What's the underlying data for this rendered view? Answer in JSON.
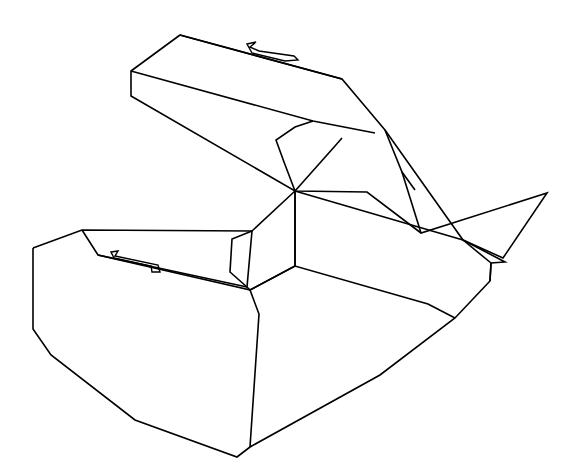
{
  "image": {
    "title": "Open box line drawing",
    "subject": "open-carton-3d-line-drawing",
    "width": 577,
    "height": 469,
    "background_color": "#ffffff",
    "line_color": "#000000",
    "line_width": 1.6,
    "style": "monochrome outline / wireframe, no fill, no text labels"
  },
  "parts": [
    {
      "id": "lid",
      "label": "Lid panel (open, raised at back)"
    },
    {
      "id": "lid-front-rim",
      "label": "Lid front rim band"
    },
    {
      "id": "lid-left-end",
      "label": "Lid left end flap"
    },
    {
      "id": "lid-right-end",
      "label": "Lid right end flap"
    },
    {
      "id": "lid-tab",
      "label": "Lid locking tab notch"
    },
    {
      "id": "lid-tongue",
      "label": "Lid tongue / closure flap"
    },
    {
      "id": "body",
      "label": "Box body / tray"
    },
    {
      "id": "body-front-panel",
      "label": "Box front panel"
    },
    {
      "id": "body-left-panel",
      "label": "Box left end panel"
    },
    {
      "id": "body-right-panel",
      "label": "Box right end panel"
    },
    {
      "id": "body-interior",
      "label": "Box interior floor"
    },
    {
      "id": "body-slot",
      "label": "Front panel tab slot"
    },
    {
      "id": "body-inner-flap",
      "label": "Inner center flap"
    }
  ],
  "geometry": {
    "lid_outline": "M 180,35 L 131,71 L 131,96 L 295,191 L 367,192 L 421,233 L 547,193 L 503,258 L 463,240 L 385,130 L 342,79 Z",
    "lid_front_fold": "M 131,71 L 313,121 L 375,133",
    "lid_top_edge": "M 180,35 L 342,79",
    "lid_right_inner": "M 385,130 L 402,172 L 415,190",
    "lid_right_fold": "M 402,172 L 421,233",
    "lid_tongue": "M 313,121 L 295,127 L 276,140 L 284,162 L 295,191 L 335,146 L 342,138",
    "lid_tab": "M 247,44 L 256,42 L 250,47 L 259,51 L 294,56 L 298,60 L 285,61 L 252,53 Z",
    "body_outline": "M 33,248 L 33,329 L 51,355 L 135,420 L 237,457 L 250,447 L 380,375 L 455,318 L 490,281 L 491,263 L 505,262 L 463,240",
    "body_top_rim": "M 33,248 L 82,230 L 252,231 L 295,191",
    "body_front_top": "M 82,230 L 98,255 L 250,290 L 259,314 L 250,447",
    "body_front_fold": "M 98,255 L 247,287",
    "body_interior_back": "M 295,191 L 463,240",
    "body_interior_right": "M 463,240 L 491,263",
    "body_interior_floor": "M 250,290 L 295,266 L 428,304 L 455,318",
    "body_inner_flap": "M 252,231 L 247,287 L 250,290 L 295,266 L 295,191",
    "body_inner_flap_left": "M 252,231 L 232,239 L 230,272 L 247,287",
    "body_center_fold": "M 295,191 L 295,266",
    "body_slot": "M 111,252 L 118,251 L 115,256 L 158,265 L 160,272 L 152,272 L 151,266 L 114,258 Z",
    "body_right_edge": "M 490,281 L 491,263"
  }
}
